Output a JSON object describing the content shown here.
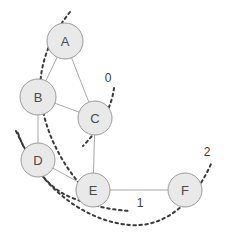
{
  "figure": {
    "background_color": "#ffffff",
    "width": 229,
    "height": 237
  },
  "chart_data": {
    "type": "diagram",
    "subtype": "undirected-graph-with-cuts",
    "title": "",
    "nodes": [
      {
        "id": "A",
        "label": "A",
        "x": 65,
        "y": 41,
        "r": 18
      },
      {
        "id": "B",
        "label": "B",
        "x": 38,
        "y": 97,
        "r": 18
      },
      {
        "id": "C",
        "label": "C",
        "x": 95,
        "y": 118,
        "r": 17
      },
      {
        "id": "D",
        "label": "D",
        "x": 38,
        "y": 160,
        "r": 17
      },
      {
        "id": "E",
        "label": "E",
        "x": 93,
        "y": 190,
        "r": 17
      },
      {
        "id": "F",
        "label": "F",
        "x": 185,
        "y": 190,
        "r": 17
      }
    ],
    "edges": [
      {
        "from": "A",
        "to": "B"
      },
      {
        "from": "A",
        "to": "C"
      },
      {
        "from": "B",
        "to": "C"
      },
      {
        "from": "B",
        "to": "D"
      },
      {
        "from": "C",
        "to": "E"
      },
      {
        "from": "D",
        "to": "E"
      },
      {
        "from": "E",
        "to": "F"
      }
    ],
    "node_style": {
      "fill": "#e9e9e9",
      "stroke": "#9a9a9a",
      "label_color": "#4a4a4a"
    },
    "edge_style": {
      "stroke": "#a8a8a8"
    },
    "cuts": [
      {
        "id": "cut-0",
        "label": "0",
        "label_x": 108,
        "label_y": 78,
        "path": "M 114 88 C 112 104, 104 124, 83 146",
        "description": "short dashed cut crossing node C"
      },
      {
        "id": "cut-1",
        "label": "1",
        "label_x": 140,
        "label_y": 203,
        "path": "M 16 131 C 30 160, 44 186, 70 197 C 92 206, 112 210, 130 211",
        "description": "dashed cut through D sweeping under E"
      },
      {
        "id": "cut-2",
        "label": "2",
        "label_x": 207,
        "label_y": 152,
        "path": "M 70 12 C 46 42, 36 74, 42 106 C 48 140, 66 168, 80 184",
        "description": "dashed cut from top crossing A and B down to E"
      },
      {
        "id": "cut-3",
        "label": "",
        "label_x": 0,
        "label_y": 0,
        "path": "M 18 133 C 34 180, 80 221, 130 225 C 168 228, 196 198, 211 164",
        "description": "long dashed arc sweeping beneath E and up through F"
      }
    ],
    "cut_style": {
      "stroke": "#3a3a3a",
      "dash": "2.5 3.5",
      "label_color": "#3a3a3a"
    }
  }
}
